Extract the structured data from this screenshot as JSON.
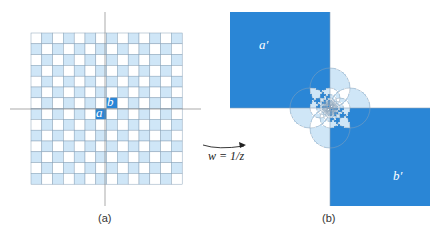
{
  "figure": {
    "panel_a": {
      "caption": "(a)",
      "grid_size": 14,
      "label_a": "a",
      "label_b": "b"
    },
    "panel_b": {
      "caption": "(b)",
      "label_a": "a′",
      "label_b": "b′"
    },
    "mapping_label": "w = 1/z",
    "colors": {
      "light": "#cfe6f7",
      "dark": "#2a86d6",
      "grid_line": "#8aa3b8",
      "axis": "#888888"
    }
  }
}
